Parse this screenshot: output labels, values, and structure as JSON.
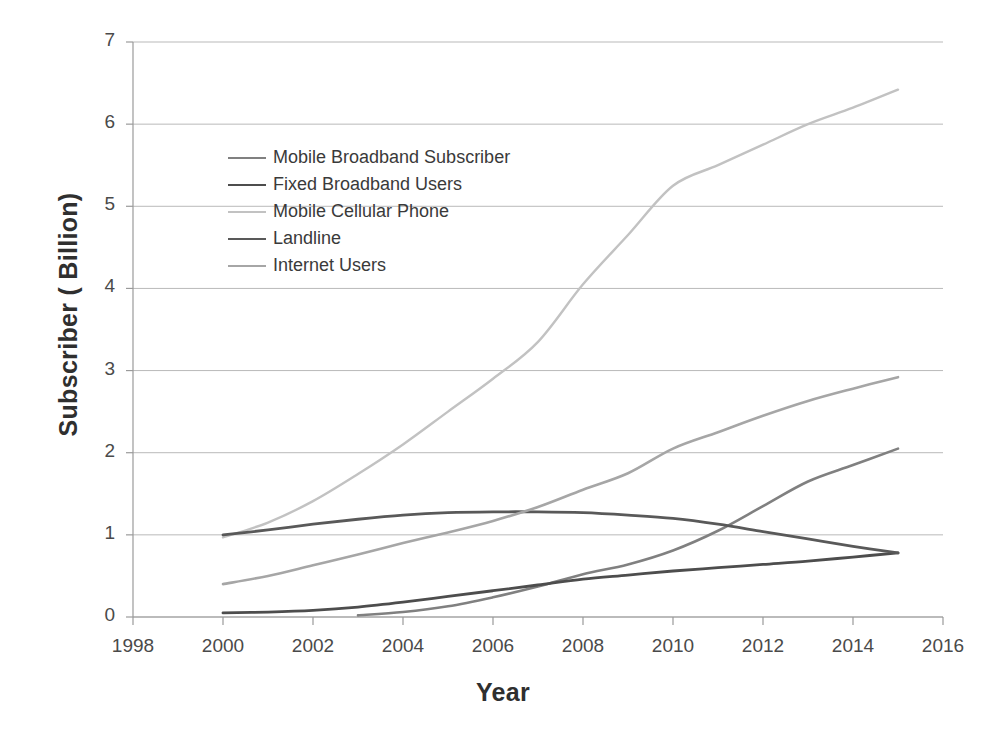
{
  "chart_data": {
    "type": "line",
    "title": "",
    "xlabel": "Year",
    "ylabel": "Subscriber ( Billion)",
    "xlim": [
      1998,
      2016
    ],
    "ylim": [
      0,
      7
    ],
    "xticks": [
      1998,
      2000,
      2002,
      2004,
      2006,
      2008,
      2010,
      2012,
      2014,
      2016
    ],
    "yticks": [
      0,
      1,
      2,
      3,
      4,
      5,
      6,
      7
    ],
    "grid": "horizontal",
    "legend_position": "inside-upper-left",
    "series": [
      {
        "name": "Mobile Broadband Subscriber",
        "color": "#808080",
        "width": 2.6,
        "x": [
          2003,
          2004,
          2005,
          2006,
          2007,
          2008,
          2009,
          2010,
          2011,
          2012,
          2013,
          2014,
          2015
        ],
        "values": [
          0.02,
          0.06,
          0.13,
          0.24,
          0.37,
          0.52,
          0.64,
          0.81,
          1.05,
          1.35,
          1.65,
          1.85,
          2.05
        ]
      },
      {
        "name": "Fixed Broadband Users",
        "color": "#4d4d4d",
        "width": 2.8,
        "x": [
          2000,
          2001,
          2002,
          2003,
          2004,
          2005,
          2006,
          2007,
          2008,
          2009,
          2010,
          2011,
          2012,
          2013,
          2014,
          2015
        ],
        "values": [
          0.05,
          0.06,
          0.08,
          0.12,
          0.18,
          0.25,
          0.32,
          0.39,
          0.46,
          0.51,
          0.56,
          0.6,
          0.64,
          0.68,
          0.73,
          0.78
        ]
      },
      {
        "name": "Mobile Cellular Phone",
        "color": "#c2c2c2",
        "width": 2.4,
        "x": [
          2000,
          2001,
          2002,
          2003,
          2004,
          2005,
          2006,
          2007,
          2008,
          2009,
          2010,
          2011,
          2012,
          2013,
          2014,
          2015
        ],
        "values": [
          0.97,
          1.15,
          1.41,
          1.74,
          2.1,
          2.5,
          2.9,
          3.35,
          4.05,
          4.65,
          5.25,
          5.5,
          5.75,
          6.0,
          6.2,
          6.42
        ]
      },
      {
        "name": "Landline",
        "color": "#595959",
        "width": 2.8,
        "x": [
          2000,
          2001,
          2002,
          2003,
          2004,
          2005,
          2006,
          2007,
          2008,
          2009,
          2010,
          2011,
          2012,
          2013,
          2014,
          2015
        ],
        "values": [
          1.0,
          1.06,
          1.13,
          1.19,
          1.24,
          1.27,
          1.28,
          1.28,
          1.27,
          1.24,
          1.2,
          1.13,
          1.04,
          0.95,
          0.86,
          0.78
        ]
      },
      {
        "name": "Internet Users",
        "color": "#a6a6a6",
        "width": 2.6,
        "x": [
          2000,
          2001,
          2002,
          2003,
          2004,
          2005,
          2006,
          2007,
          2008,
          2009,
          2010,
          2011,
          2012,
          2013,
          2014,
          2015
        ],
        "values": [
          0.4,
          0.5,
          0.63,
          0.76,
          0.9,
          1.03,
          1.17,
          1.34,
          1.55,
          1.75,
          2.05,
          2.25,
          2.45,
          2.63,
          2.78,
          2.92
        ]
      }
    ]
  },
  "legend": {
    "items": [
      {
        "label": "Mobile Broadband Subscriber"
      },
      {
        "label": "Fixed Broadband Users"
      },
      {
        "label": "Mobile Cellular Phone"
      },
      {
        "label": "Landline"
      },
      {
        "label": "Internet Users"
      }
    ]
  },
  "axes": {
    "y_title": "Subscriber ( Billion)",
    "x_title": "Year",
    "y_tick_labels": [
      "7",
      "6",
      "5",
      "4",
      "3",
      "2",
      "1",
      "0"
    ],
    "x_tick_labels": [
      "1998",
      "2000",
      "2002",
      "2004",
      "2006",
      "2008",
      "2010",
      "2012",
      "2014",
      "2016"
    ]
  },
  "style": {
    "background": "#ffffff",
    "gridline_color": "#b9b9b9",
    "axis_color": "#9a9a9a",
    "text_color": "#4a4a4a"
  }
}
